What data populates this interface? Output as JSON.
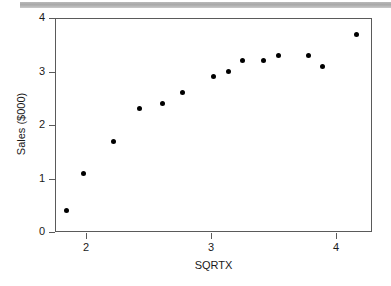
{
  "chart_data": {
    "type": "scatter",
    "title": "",
    "xlabel": "SQRTX",
    "ylabel": "Sales ($000)",
    "xlim": [
      1.76,
      4.29
    ],
    "ylim": [
      0,
      4.0
    ],
    "xticks": [
      2,
      3,
      4
    ],
    "xtick_labels": [
      "2",
      "3",
      "4"
    ],
    "yticks": [
      0,
      1,
      2,
      3,
      4
    ],
    "ytick_labels": [
      "0",
      "1",
      "2",
      "3",
      "4"
    ],
    "grid": false,
    "legend": null,
    "marker": "filled-circle",
    "marker_color": "#000000",
    "points": [
      {
        "x": 1.84,
        "y": 0.4
      },
      {
        "x": 1.98,
        "y": 1.1
      },
      {
        "x": 2.22,
        "y": 1.7
      },
      {
        "x": 2.43,
        "y": 2.3
      },
      {
        "x": 2.61,
        "y": 2.4
      },
      {
        "x": 2.77,
        "y": 2.6
      },
      {
        "x": 3.02,
        "y": 2.9
      },
      {
        "x": 3.14,
        "y": 3.0
      },
      {
        "x": 3.25,
        "y": 3.2
      },
      {
        "x": 3.42,
        "y": 3.2
      },
      {
        "x": 3.54,
        "y": 3.3
      },
      {
        "x": 3.78,
        "y": 3.3
      },
      {
        "x": 3.89,
        "y": 3.1
      },
      {
        "x": 4.16,
        "y": 3.7
      }
    ]
  },
  "colors": {
    "axis": "#5a5a5a",
    "text": "#1a1a1a",
    "marker": "#000000",
    "band": "#b0b0b0",
    "background": "#ffffff"
  }
}
